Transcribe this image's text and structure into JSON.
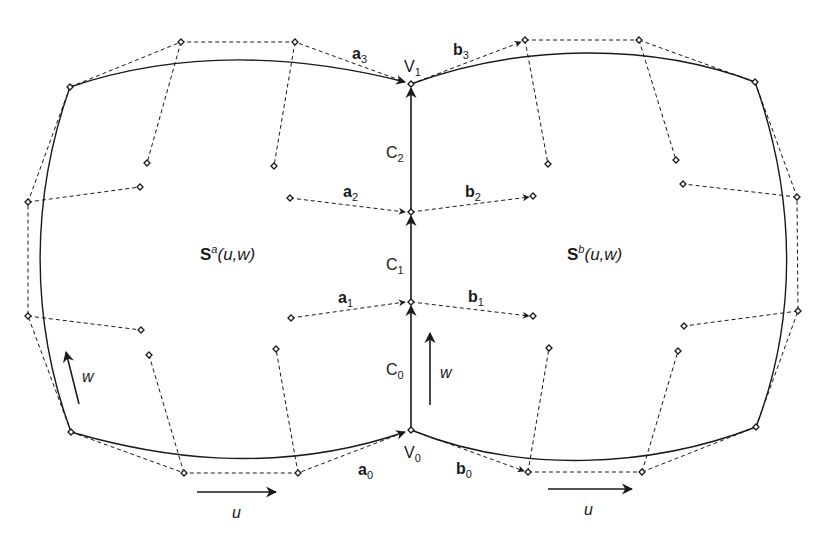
{
  "diagram": {
    "type": "bicubic-patch-continuity",
    "patch_a": {
      "label_main": "S",
      "label_sup": "a",
      "label_args": "(u,w)",
      "control_points": [
        [
          [
            70,
            87
          ],
          [
            181,
            42
          ],
          [
            295,
            42
          ],
          [
            411,
            84
          ]
        ],
        [
          [
            28,
            202
          ],
          [
            140,
            187
          ],
          [
            290,
            198
          ],
          [
            411,
            212
          ]
        ],
        [
          [
            28,
            316
          ],
          [
            141,
            330
          ],
          [
            291,
            318
          ],
          [
            411,
            302
          ]
        ],
        [
          [
            71,
            432
          ],
          [
            184,
            473
          ],
          [
            298,
            473
          ],
          [
            411,
            430
          ]
        ]
      ],
      "inner_points": [
        [
          147,
          163
        ],
        [
          274,
          166
        ],
        [
          149,
          355
        ],
        [
          276,
          349
        ]
      ]
    },
    "patch_b": {
      "label_main": "S",
      "label_sup": "b",
      "label_args": "(u,w)",
      "control_points": [
        [
          [
            411,
            84
          ],
          [
            525,
            40
          ],
          [
            639,
            40
          ],
          [
            755,
            82
          ]
        ],
        [
          [
            411,
            212
          ],
          [
            533,
            196
          ],
          [
            683,
            184
          ],
          [
            797,
            197
          ]
        ],
        [
          [
            411,
            302
          ],
          [
            533,
            316
          ],
          [
            684,
            326
          ],
          [
            798,
            311
          ]
        ],
        [
          [
            411,
            430
          ],
          [
            528,
            472
          ],
          [
            642,
            472
          ],
          [
            756,
            427
          ]
        ]
      ],
      "inner_points": [
        [
          548,
          164
        ],
        [
          676,
          160
        ],
        [
          549,
          348
        ],
        [
          678,
          351
        ]
      ]
    },
    "vectors_a": [
      {
        "name": "a",
        "sub": "0",
        "x": 358,
        "y": 475
      },
      {
        "name": "a",
        "sub": "1",
        "x": 338,
        "y": 303
      },
      {
        "name": "a",
        "sub": "2",
        "x": 343,
        "y": 197
      },
      {
        "name": "a",
        "sub": "3",
        "x": 352,
        "y": 59
      }
    ],
    "vectors_b": [
      {
        "name": "b",
        "sub": "0",
        "x": 456,
        "y": 474
      },
      {
        "name": "b",
        "sub": "1",
        "x": 468,
        "y": 302
      },
      {
        "name": "b",
        "sub": "2",
        "x": 465,
        "y": 197
      },
      {
        "name": "b",
        "sub": "3",
        "x": 453,
        "y": 55
      }
    ],
    "boundary_curves": [
      {
        "name": "C",
        "sub": "0",
        "x": 386,
        "y": 375
      },
      {
        "name": "C",
        "sub": "1",
        "x": 386,
        "y": 270
      },
      {
        "name": "C",
        "sub": "2",
        "x": 386,
        "y": 158
      }
    ],
    "vertices": [
      {
        "name": "V",
        "sub": "0",
        "x": 404,
        "y": 458
      },
      {
        "name": "V",
        "sub": "1",
        "x": 404,
        "y": 72
      }
    ],
    "parameter_axes": [
      {
        "label": "u",
        "x1": 197,
        "y1": 492,
        "x2": 276,
        "y2": 492,
        "tx": 236,
        "ty": 518
      },
      {
        "label": "u",
        "x1": 548,
        "y1": 489,
        "x2": 632,
        "y2": 489,
        "tx": 588,
        "ty": 515
      },
      {
        "label": "w",
        "x1": 79,
        "y1": 404,
        "x2": 66,
        "y2": 352,
        "tx": 88,
        "ty": 382
      },
      {
        "label": "w",
        "x1": 430,
        "y1": 405,
        "x2": 430,
        "y2": 333,
        "tx": 446,
        "ty": 378
      }
    ],
    "colors": {
      "ink": "#1a1a1a",
      "background": "#ffffff"
    }
  }
}
